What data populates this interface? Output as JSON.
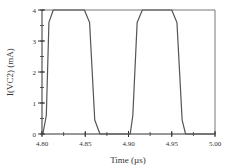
{
  "chart_data": {
    "type": "line",
    "title": "",
    "xlabel": "Time (µs)",
    "ylabel": "I(VC2)  (mA)",
    "xlim": [
      4.8,
      5.0
    ],
    "ylim": [
      0,
      4
    ],
    "grid": false,
    "legend": null,
    "x_ticks": [
      "4.80",
      "4.85",
      "4.90",
      "4.95",
      "5.00"
    ],
    "x_tick_values": [
      4.8,
      4.85,
      4.9,
      4.95,
      5.0
    ],
    "x_minor_step": 0.025,
    "y_ticks": [
      "0",
      "1",
      "2",
      "3",
      "4"
    ],
    "y_tick_values": [
      0,
      1,
      2,
      3,
      4
    ],
    "y_minor_step": 0.5,
    "series": [
      {
        "name": "I(VC2)",
        "color": "#555555",
        "x": [
          4.8,
          4.801,
          4.805,
          4.808,
          4.813,
          4.849,
          4.855,
          4.861,
          4.867,
          4.902,
          4.905,
          4.91,
          4.916,
          4.95,
          4.956,
          4.962,
          4.966,
          5.0
        ],
        "y": [
          0.0,
          0.0,
          0.6,
          3.6,
          4.0,
          4.0,
          3.6,
          0.45,
          0.0,
          0.0,
          0.6,
          3.6,
          4.0,
          4.0,
          3.6,
          0.45,
          0.0,
          0.0
        ]
      }
    ]
  },
  "colors": {
    "axis": "#333333",
    "frame": "#777777",
    "line": "#555555"
  }
}
